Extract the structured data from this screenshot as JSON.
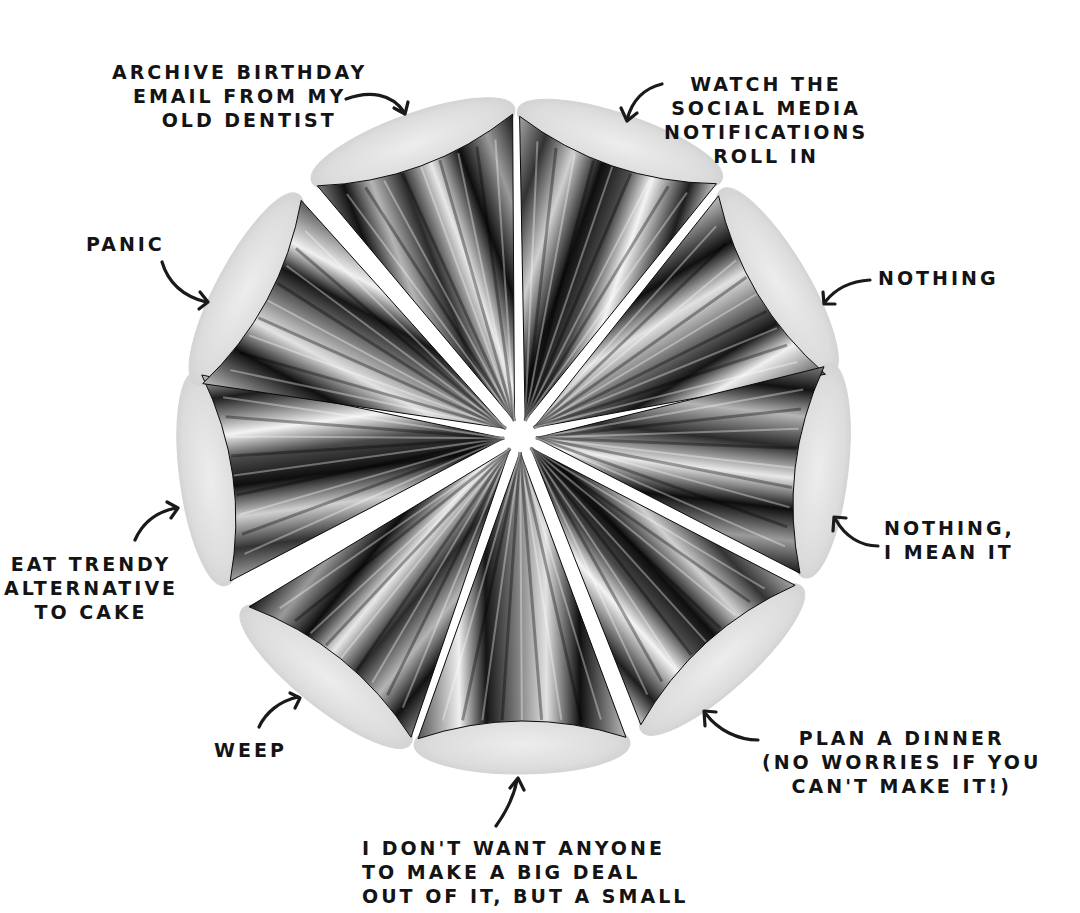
{
  "illustration": {
    "subject": "Party hat cones arranged in a circle, tips meeting at the center",
    "cone_count": 9,
    "palette": {
      "background": "#ffffff",
      "ink": "#141414",
      "metal_dark": "#0d0d0d",
      "metal_mid": "#6a6a6a",
      "metal_light": "#f2f2f2",
      "base_paper": "#e6e6e6"
    }
  },
  "labels": [
    {
      "id": "archive",
      "text": "ARCHIVE BIRTHDAY\nEMAIL FROM MY\n  OLD DENTIST"
    },
    {
      "id": "watch",
      "text": "WATCH THE\nSOCIAL MEDIA\nNOTIFICATIONS\nROLL IN"
    },
    {
      "id": "panic",
      "text": "PANIC"
    },
    {
      "id": "nothing",
      "text": "NOTHING"
    },
    {
      "id": "eat",
      "text": "EAT TRENDY\nALTERNATIVE\nTO CAKE"
    },
    {
      "id": "nothing-mean",
      "text": "NOTHING,\nI MEAN IT"
    },
    {
      "id": "weep",
      "text": "WEEP"
    },
    {
      "id": "plan",
      "text": "PLAN A DINNER\n(NO WORRIES IF YOU\nCAN'T MAKE IT!)"
    },
    {
      "id": "dont-want",
      "text": "I DON'T WANT ANYONE\nTO MAKE A BIG DEAL\nOUT OF IT, BUT A SMALL"
    }
  ]
}
